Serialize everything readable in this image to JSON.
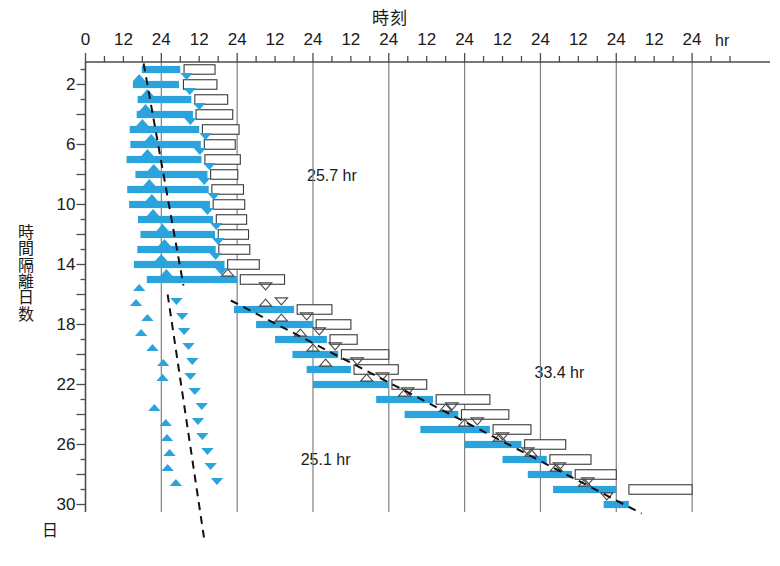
{
  "chart_data": {
    "type": "bar",
    "title": "時刻",
    "xlabel": "時刻",
    "ylabel": "時間隔離日数",
    "x_unit": "hr",
    "y_unit": "日",
    "grid": true,
    "legend_position": "none",
    "xlim": [
      0,
      204
    ],
    "ylim": [
      0.5,
      30.5
    ],
    "x_major_gridlines_hours": [
      24,
      48,
      72,
      96,
      120,
      144,
      168,
      192
    ],
    "x_minor_tick_interval_hours": 6,
    "x_tick_labels": [
      "0",
      "12",
      "24",
      "12",
      "24",
      "12",
      "24",
      "12",
      "24",
      "12",
      "24",
      "12",
      "24",
      "12",
      "24",
      "12",
      "24"
    ],
    "x_tick_values_hours": [
      0,
      12,
      24,
      36,
      48,
      60,
      72,
      84,
      96,
      108,
      120,
      132,
      144,
      156,
      168,
      180,
      192
    ],
    "y_tick_labels": [
      "2",
      "6",
      "10",
      "14",
      "18",
      "22",
      "26",
      "30"
    ],
    "y_tick_values": [
      2,
      6,
      10,
      14,
      18,
      22,
      26,
      30
    ],
    "colors": {
      "sleep_bar": "#2BA3DC",
      "marker_filled": "#2BA3DC",
      "marker_outline": "#4a4a4a",
      "rect_outline": "#3a3a3a",
      "rect_fill": "#ffffff",
      "gridline": "#808080",
      "axis": "#4d4d4d",
      "trend_line": "#111111",
      "text": "#1a1a1a"
    },
    "annotations": [
      {
        "text": "25.7 hr",
        "x_hours": 78,
        "y_day": 8.1
      },
      {
        "text": "25.1 hr",
        "x_hours": 76,
        "y_day": 27.0
      },
      {
        "text": "33.4 hr",
        "x_hours": 150,
        "y_day": 21.2
      }
    ],
    "series": [
      {
        "name": "睡眠期間 (sleep episode)",
        "kind": "horizontal_bar",
        "marker": "thick-blue-bar",
        "bars": [
          {
            "day": 1,
            "start_hours": 17.8,
            "end_hours": 30.0
          },
          {
            "day": 2,
            "start_hours": 15.0,
            "end_hours": 29.6
          },
          {
            "day": 3,
            "start_hours": 16.5,
            "end_hours": 33.5
          },
          {
            "day": 4,
            "start_hours": 16.2,
            "end_hours": 34.0
          },
          {
            "day": 5,
            "start_hours": 14.0,
            "end_hours": 36.0
          },
          {
            "day": 6,
            "start_hours": 14.2,
            "end_hours": 36.5
          },
          {
            "day": 7,
            "start_hours": 13.0,
            "end_hours": 36.7
          },
          {
            "day": 8,
            "start_hours": 15.8,
            "end_hours": 38.6
          },
          {
            "day": 9,
            "start_hours": 13.2,
            "end_hours": 39.0
          },
          {
            "day": 10,
            "start_hours": 13.8,
            "end_hours": 39.4
          },
          {
            "day": 11,
            "start_hours": 16.6,
            "end_hours": 40.4
          },
          {
            "day": 12,
            "start_hours": 17.4,
            "end_hours": 41.0
          },
          {
            "day": 13,
            "start_hours": 16.4,
            "end_hours": 41.2
          },
          {
            "day": 14,
            "start_hours": 15.3,
            "end_hours": 44.0
          },
          {
            "day": 15,
            "start_hours": 19.4,
            "end_hours": 48.0
          },
          {
            "day": 17,
            "start_hours": 47.0,
            "end_hours": 66.0
          },
          {
            "day": 18,
            "start_hours": 54.0,
            "end_hours": 72.0
          },
          {
            "day": 19,
            "start_hours": 60.0,
            "end_hours": 76.4
          },
          {
            "day": 20,
            "start_hours": 65.5,
            "end_hours": 80.0
          },
          {
            "day": 21,
            "start_hours": 70.0,
            "end_hours": 84.0
          },
          {
            "day": 22,
            "start_hours": 72.0,
            "end_hours": 96.0
          },
          {
            "day": 23,
            "start_hours": 92.0,
            "end_hours": 110.0
          },
          {
            "day": 24,
            "start_hours": 101.0,
            "end_hours": 118.0
          },
          {
            "day": 25,
            "start_hours": 106.0,
            "end_hours": 128.0
          },
          {
            "day": 26,
            "start_hours": 120.0,
            "end_hours": 138.0
          },
          {
            "day": 27,
            "start_hours": 132.0,
            "end_hours": 146.0
          },
          {
            "day": 28,
            "start_hours": 140.0,
            "end_hours": 154.0
          },
          {
            "day": 29,
            "start_hours": 148.0,
            "end_hours": 168.0
          },
          {
            "day": 30,
            "start_hours": 164.0,
            "end_hours": 172.0
          }
        ]
      },
      {
        "name": "覚醒期間 (open rectangle)",
        "kind": "horizontal_open_rect",
        "marker": "white-outlined-rectangle",
        "bars": [
          {
            "day": 1,
            "start_hours": 31.2,
            "end_hours": 41.0
          },
          {
            "day": 2,
            "start_hours": 31.0,
            "end_hours": 41.6
          },
          {
            "day": 3,
            "start_hours": 34.6,
            "end_hours": 45.0
          },
          {
            "day": 4,
            "start_hours": 35.0,
            "end_hours": 46.6
          },
          {
            "day": 5,
            "start_hours": 37.0,
            "end_hours": 48.6
          },
          {
            "day": 6,
            "start_hours": 37.6,
            "end_hours": 47.4
          },
          {
            "day": 7,
            "start_hours": 37.8,
            "end_hours": 49.0
          },
          {
            "day": 8,
            "start_hours": 39.6,
            "end_hours": 48.2
          },
          {
            "day": 9,
            "start_hours": 40.0,
            "end_hours": 50.0
          },
          {
            "day": 10,
            "start_hours": 40.4,
            "end_hours": 50.4
          },
          {
            "day": 11,
            "start_hours": 41.4,
            "end_hours": 51.0
          },
          {
            "day": 12,
            "start_hours": 42.0,
            "end_hours": 51.6
          },
          {
            "day": 13,
            "start_hours": 42.2,
            "end_hours": 52.0
          },
          {
            "day": 14,
            "start_hours": 45.0,
            "end_hours": 55.0
          },
          {
            "day": 15,
            "start_hours": 49.0,
            "end_hours": 63.0
          },
          {
            "day": 17,
            "start_hours": 67.0,
            "end_hours": 78.0
          },
          {
            "day": 18,
            "start_hours": 73.0,
            "end_hours": 84.0
          },
          {
            "day": 19,
            "start_hours": 77.4,
            "end_hours": 86.0
          },
          {
            "day": 20,
            "start_hours": 81.0,
            "end_hours": 96.0
          },
          {
            "day": 21,
            "start_hours": 85.0,
            "end_hours": 99.0
          },
          {
            "day": 22,
            "start_hours": 97.0,
            "end_hours": 108.0
          },
          {
            "day": 23,
            "start_hours": 111.0,
            "end_hours": 128.0
          },
          {
            "day": 24,
            "start_hours": 119.0,
            "end_hours": 134.0
          },
          {
            "day": 25,
            "start_hours": 129.0,
            "end_hours": 141.0
          },
          {
            "day": 26,
            "start_hours": 139.0,
            "end_hours": 152.0
          },
          {
            "day": 27,
            "start_hours": 147.0,
            "end_hours": 160.0
          },
          {
            "day": 28,
            "start_hours": 155.0,
            "end_hours": 168.0
          },
          {
            "day": 29,
            "start_hours": 172.0,
            "end_hours": 192.0
          }
        ]
      },
      {
        "name": "体温最低時刻 (up-triangle)",
        "kind": "marker",
        "marker": "triangle-up",
        "points": [
          {
            "day": 2,
            "x_hours": 17.0,
            "filled": true
          },
          {
            "day": 3,
            "x_hours": 19.6,
            "filled": true
          },
          {
            "day": 4,
            "x_hours": 19.0,
            "filled": true
          },
          {
            "day": 5,
            "x_hours": 18.0,
            "filled": true
          },
          {
            "day": 6,
            "x_hours": 20.8,
            "filled": true
          },
          {
            "day": 7,
            "x_hours": 19.6,
            "filled": true
          },
          {
            "day": 8,
            "x_hours": 21.6,
            "filled": true
          },
          {
            "day": 9,
            "x_hours": 20.2,
            "filled": true
          },
          {
            "day": 10,
            "x_hours": 21.0,
            "filled": true
          },
          {
            "day": 11,
            "x_hours": 21.4,
            "filled": true
          },
          {
            "day": 12,
            "x_hours": 24.4,
            "filled": true
          },
          {
            "day": 13,
            "x_hours": 25.0,
            "filled": true
          },
          {
            "day": 14,
            "x_hours": 24.0,
            "filled": true
          },
          {
            "day": 15,
            "x_hours": 25.6,
            "filled": true
          },
          {
            "day": 16,
            "x_hours": 17.0,
            "filled": true
          },
          {
            "day": 17,
            "x_hours": 16.0,
            "filled": true
          },
          {
            "day": 18,
            "x_hours": 19.6,
            "filled": true
          },
          {
            "day": 19,
            "x_hours": 17.6,
            "filled": true
          },
          {
            "day": 20,
            "x_hours": 21.2,
            "filled": true
          },
          {
            "day": 21,
            "x_hours": 24.6,
            "filled": true
          },
          {
            "day": 22,
            "x_hours": 24.4,
            "filled": true
          },
          {
            "day": 24,
            "x_hours": 21.8,
            "filled": true
          },
          {
            "day": 25,
            "x_hours": 25.4,
            "filled": true
          },
          {
            "day": 26,
            "x_hours": 25.8,
            "filled": true
          },
          {
            "day": 27,
            "x_hours": 26.6,
            "filled": true
          },
          {
            "day": 28,
            "x_hours": 26.0,
            "filled": true
          },
          {
            "day": 29,
            "x_hours": 28.6,
            "filled": true
          },
          {
            "day": 15,
            "x_hours": 45.0,
            "filled": false
          },
          {
            "day": 17,
            "x_hours": 57.0,
            "filled": false
          },
          {
            "day": 18,
            "x_hours": 62.0,
            "filled": false
          },
          {
            "day": 19,
            "x_hours": 68.0,
            "filled": false
          },
          {
            "day": 20,
            "x_hours": 72.0,
            "filled": false
          },
          {
            "day": 21,
            "x_hours": 76.0,
            "filled": false
          },
          {
            "day": 22,
            "x_hours": 89.0,
            "filled": false
          },
          {
            "day": 23,
            "x_hours": 101.0,
            "filled": false
          },
          {
            "day": 24,
            "x_hours": 114.0,
            "filled": false
          },
          {
            "day": 25,
            "x_hours": 120.0,
            "filled": false
          },
          {
            "day": 26,
            "x_hours": 131.0,
            "filled": false
          },
          {
            "day": 27,
            "x_hours": 141.0,
            "filled": false
          },
          {
            "day": 28,
            "x_hours": 149.0,
            "filled": false
          },
          {
            "day": 29,
            "x_hours": 158.0,
            "filled": false
          }
        ]
      },
      {
        "name": "体温最高時刻 (down-triangle)",
        "kind": "marker",
        "marker": "triangle-down",
        "points": [
          {
            "day": 1,
            "x_hours": 32.0,
            "filled": true
          },
          {
            "day": 2,
            "x_hours": 33.0,
            "filled": true
          },
          {
            "day": 3,
            "x_hours": 36.0,
            "filled": true
          },
          {
            "day": 4,
            "x_hours": 33.2,
            "filled": true
          },
          {
            "day": 5,
            "x_hours": 38.0,
            "filled": true
          },
          {
            "day": 6,
            "x_hours": 36.2,
            "filled": true
          },
          {
            "day": 7,
            "x_hours": 39.2,
            "filled": true
          },
          {
            "day": 8,
            "x_hours": 37.6,
            "filled": true
          },
          {
            "day": 9,
            "x_hours": 40.6,
            "filled": true
          },
          {
            "day": 10,
            "x_hours": 38.6,
            "filled": true
          },
          {
            "day": 11,
            "x_hours": 41.4,
            "filled": true
          },
          {
            "day": 12,
            "x_hours": 42.0,
            "filled": true
          },
          {
            "day": 13,
            "x_hours": 41.2,
            "filled": true
          },
          {
            "day": 14,
            "x_hours": 43.0,
            "filled": true
          },
          {
            "day": 16,
            "x_hours": 28.8,
            "filled": true
          },
          {
            "day": 17,
            "x_hours": 30.6,
            "filled": true
          },
          {
            "day": 18,
            "x_hours": 31.2,
            "filled": true
          },
          {
            "day": 19,
            "x_hours": 32.6,
            "filled": true
          },
          {
            "day": 20,
            "x_hours": 33.8,
            "filled": true
          },
          {
            "day": 21,
            "x_hours": 33.2,
            "filled": true
          },
          {
            "day": 22,
            "x_hours": 34.6,
            "filled": true
          },
          {
            "day": 23,
            "x_hours": 36.8,
            "filled": true
          },
          {
            "day": 24,
            "x_hours": 35.6,
            "filled": true
          },
          {
            "day": 25,
            "x_hours": 37.0,
            "filled": true
          },
          {
            "day": 26,
            "x_hours": 38.6,
            "filled": true
          },
          {
            "day": 27,
            "x_hours": 39.6,
            "filled": true
          },
          {
            "day": 28,
            "x_hours": 41.6,
            "filled": true
          },
          {
            "day": 15,
            "x_hours": 57.0,
            "filled": false
          },
          {
            "day": 16,
            "x_hours": 62.0,
            "filled": false
          },
          {
            "day": 17,
            "x_hours": 70.0,
            "filled": false
          },
          {
            "day": 18,
            "x_hours": 74.0,
            "filled": false
          },
          {
            "day": 19,
            "x_hours": 79.0,
            "filled": false
          },
          {
            "day": 20,
            "x_hours": 86.0,
            "filled": false
          },
          {
            "day": 21,
            "x_hours": 94.0,
            "filled": false
          },
          {
            "day": 22,
            "x_hours": 102.0,
            "filled": false
          },
          {
            "day": 23,
            "x_hours": 116.0,
            "filled": false
          },
          {
            "day": 24,
            "x_hours": 124.0,
            "filled": false
          },
          {
            "day": 25,
            "x_hours": 132.0,
            "filled": false
          },
          {
            "day": 26,
            "x_hours": 140.0,
            "filled": false
          },
          {
            "day": 27,
            "x_hours": 150.0,
            "filled": false
          },
          {
            "day": 28,
            "x_hours": 159.0,
            "filled": false
          },
          {
            "day": 29,
            "x_hours": 165.0,
            "filled": false
          }
        ]
      },
      {
        "name": "回帰直線 (dashed trend segments)",
        "kind": "dashed_line",
        "segments": [
          {
            "points": [
              [
                18.4,
                0.6
              ],
              [
                31.0,
                15.4
              ]
            ]
          },
          {
            "points": [
              [
                26.0,
                16.0
              ],
              [
                37.5,
                32.2
              ]
            ]
          },
          {
            "points": [
              [
                46.0,
                16.4
              ],
              [
                176.0,
                30.6
              ]
            ]
          }
        ]
      }
    ]
  }
}
